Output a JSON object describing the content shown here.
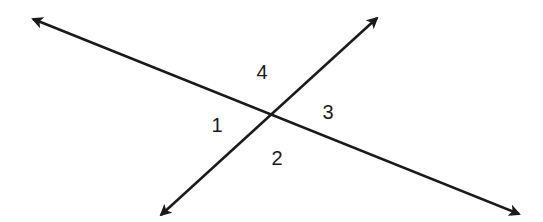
{
  "diagram": {
    "type": "intersecting-lines-angles",
    "stroke_color": "#1a1a1a",
    "background": "#ffffff",
    "intersection": {
      "x": 271,
      "y": 116
    },
    "lines": [
      {
        "name": "line-a",
        "from": {
          "x": 33,
          "y": 19
        },
        "to": {
          "x": 519,
          "y": 214
        },
        "arrows": "both"
      },
      {
        "name": "line-b",
        "from": {
          "x": 161,
          "y": 215
        },
        "to": {
          "x": 377,
          "y": 18
        },
        "arrows": "both"
      }
    ],
    "angle_labels": [
      {
        "text": "4",
        "x": 262,
        "y": 72
      },
      {
        "text": "1",
        "x": 217,
        "y": 125
      },
      {
        "text": "3",
        "x": 328,
        "y": 112
      },
      {
        "text": "2",
        "x": 277,
        "y": 158
      }
    ]
  }
}
